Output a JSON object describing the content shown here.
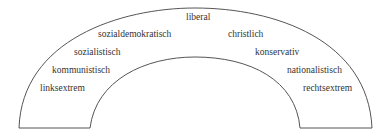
{
  "diagram": {
    "type": "political-spectrum-arc",
    "colors": {
      "stroke": "#555555",
      "text": "#333333",
      "background": "#ffffff"
    },
    "labels": [
      {
        "id": "linksextrem",
        "text": "linksextrem",
        "x": 40,
        "y": 91
      },
      {
        "id": "kommunistisch",
        "text": "kommunistisch",
        "x": 52,
        "y": 73
      },
      {
        "id": "sozialistisch",
        "text": "sozialistisch",
        "x": 74,
        "y": 55
      },
      {
        "id": "sozialdemokratisch",
        "text": "sozialdemokratisch",
        "x": 98,
        "y": 37
      },
      {
        "id": "liberal",
        "text": "liberal",
        "x": 186,
        "y": 20
      },
      {
        "id": "christlich",
        "text": "christlich",
        "x": 228,
        "y": 37
      },
      {
        "id": "konservativ",
        "text": "konservativ",
        "x": 255,
        "y": 55
      },
      {
        "id": "nationalistisch",
        "text": "nationalistisch",
        "x": 287,
        "y": 73
      },
      {
        "id": "rechtsextrem",
        "text": "rechtsextrem",
        "x": 303,
        "y": 91
      }
    ]
  }
}
